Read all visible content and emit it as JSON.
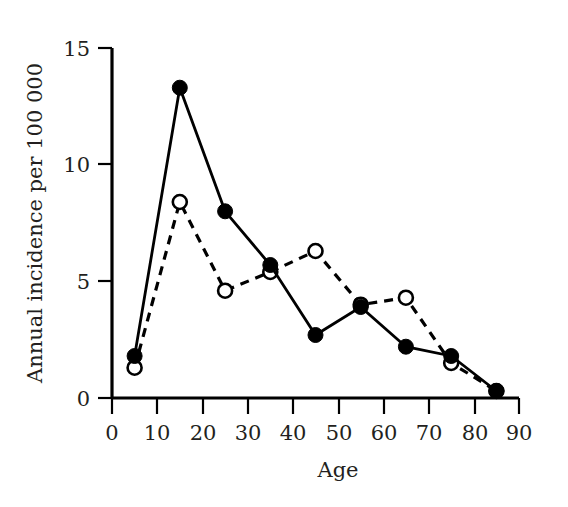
{
  "chart_data": {
    "type": "line",
    "title": "",
    "xlabel": "Age",
    "ylabel": "Annual incidence per 100 000",
    "x": [
      5,
      15,
      25,
      35,
      45,
      55,
      65,
      75,
      85
    ],
    "xlim": [
      0,
      90
    ],
    "ylim": [
      0,
      15
    ],
    "xticks": [
      0,
      10,
      20,
      30,
      40,
      50,
      60,
      70,
      80,
      90
    ],
    "yticks": [
      0,
      5,
      10,
      15
    ],
    "xtick_labels": [
      "0",
      "10",
      "20",
      "30",
      "40",
      "50",
      "60",
      "70",
      "80",
      "90"
    ],
    "ytick_labels": [
      "0",
      "5",
      "10",
      "15"
    ],
    "grid": false,
    "legend": "none",
    "series": [
      {
        "name": "solid-filled-circle-series",
        "marker": "filled-circle",
        "line_style": "solid",
        "color": "#000000",
        "values": [
          1.8,
          13.3,
          8.0,
          5.7,
          2.7,
          3.9,
          2.2,
          1.8,
          0.3
        ]
      },
      {
        "name": "dashed-open-circle-series",
        "marker": "open-circle",
        "line_style": "dashed",
        "color": "#000000",
        "values": [
          1.3,
          8.4,
          4.6,
          5.4,
          6.3,
          4.0,
          4.3,
          1.5,
          0.3
        ]
      }
    ]
  },
  "axes": {
    "x_axis_title": "Age",
    "y_axis_title": "Annual incidence per 100 000"
  }
}
